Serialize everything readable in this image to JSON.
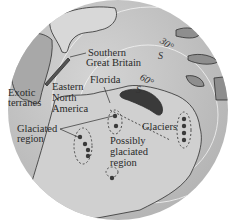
{
  "map": {
    "projection": "polar (south pole) globe view",
    "colors": {
      "ocean": "#c9c9c9",
      "land": "#d6d6d6",
      "exotic_land": "#9a9a9a",
      "glacier": "#3a3a3a",
      "outline": "#2e2e2e",
      "latitude_circle": "#f2f2f2"
    },
    "latitudes": [
      {
        "label_deg": "30°",
        "label_hem": "S"
      },
      {
        "label_deg": "60°",
        "label_hem": "S"
      }
    ],
    "labels": {
      "southern_great_britain_1": "Southern",
      "southern_great_britain_2": "Great Britain",
      "florida": "Florida",
      "exotic_1": "Exotic",
      "exotic_2": "terranes",
      "eastern_1": "Eastern",
      "eastern_2": "North",
      "eastern_3": "America",
      "glaciated_1": "Glaciated",
      "glaciated_2": "region",
      "possibly_1": "Possibly",
      "possibly_2": "glaciated",
      "possibly_3": "region",
      "glaciers": "Glaciers"
    }
  }
}
